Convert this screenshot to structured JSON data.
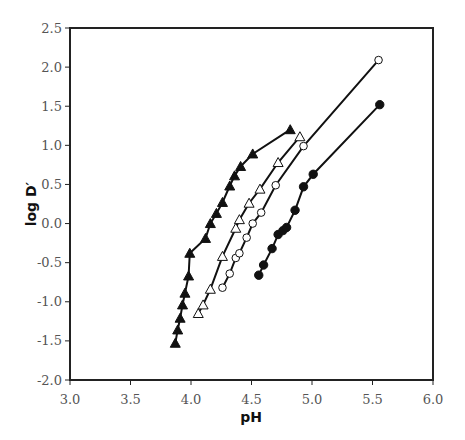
{
  "chart_data": {
    "type": "line",
    "title": "",
    "xlabel": "pH",
    "ylabel": "log D′",
    "xlim": [
      3.0,
      6.0
    ],
    "ylim": [
      -2.0,
      2.5
    ],
    "xticks": [
      "3.0",
      "3.5",
      "4.0",
      "4.5",
      "5.0",
      "5.5",
      "6.0"
    ],
    "yticks": [
      "2.5",
      "2.0",
      "1.5",
      "1.0",
      "0.5",
      "0.0",
      "-0.5",
      "-1.0",
      "-1.5",
      "-2.0"
    ],
    "grid": false,
    "legend": null,
    "series": [
      {
        "name": "filled-triangles",
        "marker": "triangle-filled",
        "x": [
          3.87,
          3.89,
          3.91,
          3.93,
          3.95,
          3.98,
          3.99,
          4.12,
          4.16,
          4.21,
          4.26,
          4.32,
          4.36,
          4.41,
          4.51,
          4.82
        ],
        "y": [
          -1.53,
          -1.36,
          -1.21,
          -1.04,
          -0.89,
          -0.67,
          -0.38,
          -0.19,
          0.0,
          0.13,
          0.27,
          0.48,
          0.61,
          0.73,
          0.89,
          1.2
        ]
      },
      {
        "name": "open-triangles",
        "marker": "triangle-open",
        "x": [
          4.06,
          4.1,
          4.16,
          4.26,
          4.37,
          4.4,
          4.48,
          4.57,
          4.72,
          4.9
        ],
        "y": [
          -1.15,
          -1.04,
          -0.84,
          -0.42,
          -0.06,
          0.05,
          0.26,
          0.44,
          0.78,
          1.11
        ]
      },
      {
        "name": "open-circles",
        "marker": "circle-open",
        "x": [
          4.26,
          4.32,
          4.37,
          4.4,
          4.46,
          4.51,
          4.58,
          4.7,
          4.93,
          5.55
        ],
        "y": [
          -0.82,
          -0.64,
          -0.44,
          -0.38,
          -0.18,
          0.0,
          0.14,
          0.49,
          0.99,
          2.09
        ]
      },
      {
        "name": "filled-circles",
        "marker": "circle-filled",
        "x": [
          4.56,
          4.6,
          4.67,
          4.72,
          4.76,
          4.79,
          4.86,
          4.93,
          5.01,
          5.56
        ],
        "y": [
          -0.66,
          -0.53,
          -0.32,
          -0.14,
          -0.09,
          -0.05,
          0.17,
          0.47,
          0.63,
          1.52
        ]
      }
    ]
  },
  "axes": {
    "x_title": "pH",
    "y_title": "log D′",
    "x_ticks": [
      "3.0",
      "3.5",
      "4.0",
      "4.5",
      "5.0",
      "5.5",
      "6.0"
    ],
    "y_ticks": [
      "2.5",
      "2.0",
      "1.5",
      "1.0",
      "0.5",
      "0.0",
      "-0.5",
      "-1.0",
      "-1.5",
      "-2.0"
    ]
  },
  "colors": {
    "line": "#111111",
    "axis": "#222222",
    "tick_label": "#555555",
    "background": "#ffffff"
  }
}
